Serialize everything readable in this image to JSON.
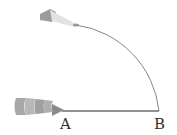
{
  "diagram": {
    "type": "geometry-construction",
    "points": [
      {
        "label": "A",
        "x": 62,
        "y": 111
      },
      {
        "label": "B",
        "x": 159,
        "y": 111
      }
    ],
    "segment": {
      "from": "A",
      "to": "B"
    },
    "arc": {
      "center": "A",
      "radius": 97,
      "from": "B",
      "to_angle_deg": 112
    },
    "colors": {
      "line": "#222222",
      "arc": "#555555",
      "tool": "#9a9a9a"
    }
  }
}
